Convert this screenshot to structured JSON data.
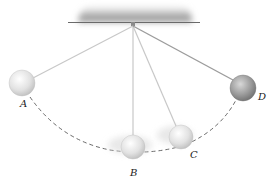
{
  "diagram": {
    "type": "pendulum-positions",
    "pivot": {
      "x": 133,
      "y": 26
    },
    "ceiling": {
      "x1": 68,
      "x2": 200,
      "y": 22
    },
    "path_style": "dashed-arc",
    "colors": {
      "ceiling_shade": "#9a9a9a",
      "string": "#c8c8c8",
      "string_dark": "#9c9c9c",
      "ball_light": "#e6e6e6",
      "ball_dark": "#8a8a8a",
      "dash": "#444444"
    },
    "positions": [
      {
        "label": "A",
        "x": 22,
        "y": 83,
        "r": 13,
        "label_x": 20,
        "label_y": 107,
        "shade": "light"
      },
      {
        "label": "B",
        "x": 133,
        "y": 147,
        "r": 12,
        "label_x": 130,
        "label_y": 176,
        "shade": "light"
      },
      {
        "label": "C",
        "x": 181,
        "y": 137,
        "r": 12,
        "label_x": 190,
        "label_y": 158,
        "shade": "light"
      },
      {
        "label": "D",
        "x": 243,
        "y": 88,
        "r": 13,
        "label_x": 258,
        "label_y": 100,
        "shade": "dark"
      }
    ]
  }
}
